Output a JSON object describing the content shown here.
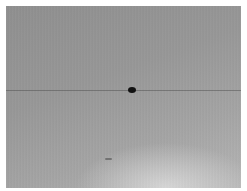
{
  "image": {
    "description": "Grayscale photograph of a plain gray surface with a faint horizontal line and a small dark spot",
    "colors": {
      "border": "#ffffff",
      "surface_dark": "#8e8e8e",
      "surface_light": "#b4b4b4",
      "spot": "#111111"
    },
    "features": [
      {
        "name": "horizontal-line",
        "label": "faint horizontal line"
      },
      {
        "name": "dark-spot",
        "label": "dark oval spot"
      },
      {
        "name": "small-mark",
        "label": "small dark dash"
      }
    ]
  }
}
